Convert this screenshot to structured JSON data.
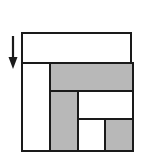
{
  "figure": {
    "title": "",
    "colors": {
      "fill_gray": "#b8b8b8",
      "fill_white": "#ffffff",
      "stroke": "#1a1a1a",
      "background": "#ffffff"
    },
    "arrow": {
      "name": "down-arrow",
      "direction": "down",
      "label": ""
    },
    "outer_rect": {
      "label": "",
      "x": 21,
      "y": 32,
      "width": 111,
      "height": 116
    },
    "cells": [
      {
        "id": "top-band",
        "label": "",
        "fill": "white",
        "x": 0,
        "y": 0,
        "width": 111,
        "height": 32
      },
      {
        "id": "left-column",
        "label": "",
        "fill": "white",
        "x": 0,
        "y": 30,
        "width": 28,
        "height": 86
      },
      {
        "id": "gray-band",
        "label": "",
        "fill": "gray",
        "x": 28,
        "y": 30,
        "width": 83,
        "height": 28
      },
      {
        "id": "gray-column",
        "label": "",
        "fill": "gray",
        "x": 28,
        "y": 58,
        "width": 28,
        "height": 58
      },
      {
        "id": "mid-right-box",
        "label": "",
        "fill": "white",
        "x": 56,
        "y": 58,
        "width": 55,
        "height": 28
      },
      {
        "id": "bottom-white",
        "label": "",
        "fill": "white",
        "x": 56,
        "y": 86,
        "width": 27,
        "height": 30
      },
      {
        "id": "bottom-gray",
        "label": "",
        "fill": "gray",
        "x": 83,
        "y": 86,
        "width": 28,
        "height": 30
      }
    ]
  }
}
